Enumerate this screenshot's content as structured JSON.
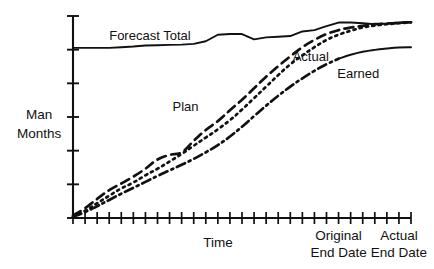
{
  "chart_data": {
    "type": "line",
    "title": "",
    "subtitle": "",
    "xlabel": "Time",
    "ylabel": "Man Months",
    "ylabel_lines": [
      "Man",
      "Months"
    ],
    "grid": false,
    "legend_position": "inline-annotations",
    "xlim": [
      0,
      28
    ],
    "ylim": [
      0,
      6.15
    ],
    "x_tick_count": 28,
    "y_tick_count": 7,
    "x_axis_annotations": [
      {
        "name": "original-end-date",
        "x": 22,
        "lines": [
          "Original",
          "End Date"
        ]
      },
      {
        "name": "actual-end-date",
        "x": 27,
        "lines": [
          "Actual",
          "End Date"
        ]
      }
    ],
    "series": [
      {
        "name": "Forecast Total",
        "style": "solid",
        "label_x": 3.0,
        "label_y": 5.42,
        "x": [
          0,
          1,
          2,
          3,
          4,
          5,
          6,
          7,
          8,
          9,
          10,
          11,
          12,
          13,
          14,
          15,
          16,
          17,
          18,
          19,
          20,
          21,
          22,
          23,
          24,
          25,
          26,
          27,
          28
        ],
        "values": [
          5.18,
          5.18,
          5.18,
          5.18,
          5.2,
          5.22,
          5.25,
          5.26,
          5.27,
          5.28,
          5.3,
          5.38,
          5.58,
          5.6,
          5.6,
          5.44,
          5.5,
          5.52,
          5.54,
          5.68,
          5.72,
          5.84,
          5.95,
          5.95,
          5.93,
          5.9,
          5.92,
          5.95,
          5.96
        ]
      },
      {
        "name": "Plan",
        "style": "long-dash",
        "label_x": 10.4,
        "label_y": 3.25,
        "x": [
          0,
          1,
          2,
          3,
          4,
          5,
          6,
          7,
          8,
          9,
          10,
          11,
          12,
          13,
          14,
          15,
          16,
          17,
          18,
          19,
          20,
          21,
          22,
          23,
          24,
          25,
          26,
          27,
          28
        ],
        "values": [
          0.08,
          0.3,
          0.58,
          0.85,
          1.05,
          1.26,
          1.5,
          1.78,
          1.92,
          2.0,
          2.35,
          2.68,
          2.95,
          3.28,
          3.6,
          3.95,
          4.3,
          4.62,
          4.92,
          5.2,
          5.42,
          5.6,
          5.72,
          5.8,
          5.85,
          5.9,
          5.92,
          5.94,
          5.96
        ]
      },
      {
        "name": "Actual",
        "style": "dotted",
        "label_x": 18.2,
        "label_y": 4.78,
        "x": [
          0,
          1,
          2,
          3,
          4,
          5,
          6,
          7,
          8,
          9,
          10,
          11,
          12,
          13,
          14,
          15,
          16,
          17,
          18,
          19,
          20,
          21,
          22,
          23,
          24,
          25,
          26,
          27,
          28
        ],
        "values": [
          0.05,
          0.22,
          0.45,
          0.68,
          0.9,
          1.08,
          1.3,
          1.5,
          1.72,
          1.95,
          2.2,
          2.45,
          2.7,
          2.98,
          3.3,
          3.65,
          4.0,
          4.35,
          4.68,
          4.95,
          5.2,
          5.42,
          5.58,
          5.7,
          5.8,
          5.86,
          5.9,
          5.93,
          5.96
        ]
      },
      {
        "name": "Earned",
        "style": "dash-dot",
        "label_x": 21.9,
        "label_y": 4.25,
        "x": [
          0,
          1,
          2,
          3,
          4,
          5,
          6,
          7,
          8,
          9,
          10,
          11,
          12,
          13,
          14,
          15,
          16,
          17,
          18,
          19,
          20,
          21,
          22,
          23,
          24,
          25,
          26,
          27,
          28
        ],
        "values": [
          0.04,
          0.18,
          0.36,
          0.55,
          0.74,
          0.92,
          1.1,
          1.28,
          1.45,
          1.62,
          1.8,
          2.0,
          2.22,
          2.48,
          2.78,
          3.1,
          3.42,
          3.72,
          4.0,
          4.25,
          4.48,
          4.68,
          4.85,
          4.97,
          5.06,
          5.12,
          5.16,
          5.19,
          5.2
        ]
      }
    ]
  },
  "labels": {
    "y_axis_line1": "Man",
    "y_axis_line2": "Months",
    "x_axis": "Time",
    "original_end_date_line1": "Original",
    "original_end_date_line2": "End Date",
    "actual_end_date_line1": "Actual",
    "actual_end_date_line2": "End Date",
    "series_forecast_total": "Forecast Total",
    "series_plan": "Plan",
    "series_actual": "Actual",
    "series_earned": "Earned"
  },
  "colors": {
    "ink": "#111111",
    "background": "#ffffff"
  }
}
